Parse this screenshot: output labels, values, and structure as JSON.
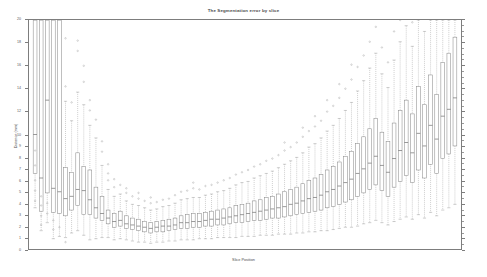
{
  "chart_data": {
    "type": "boxplot",
    "title": "The Segmentation error by slice",
    "xlabel": "Slice Position",
    "ylabel": "Distance (mm)",
    "ylim": [
      0,
      20
    ],
    "xlim": [
      0,
      71
    ],
    "grid": false,
    "legend": null,
    "y_major_ticks": [
      0,
      1,
      2,
      3,
      4,
      5,
      6,
      7,
      8,
      9,
      10,
      12,
      14,
      16,
      18,
      20
    ],
    "y_tick_labels": [
      "0",
      "1",
      "2",
      "3",
      "4",
      "5",
      "6",
      "7",
      "8",
      "9",
      "10",
      "12",
      "14",
      "16",
      "18",
      "20"
    ],
    "x_tick_labels": [],
    "box_color": "#8c8c8c",
    "whisker_color": "#9e9e9e",
    "median_color": "#6e6e6e",
    "outlier_color": "#a8a8a8",
    "n_boxes": 70,
    "boxes": [
      {
        "x": 1,
        "q1": 6.6,
        "median": 10.0,
        "q3": 20.0,
        "whisker_low": 3.6,
        "whisker_high": 20.0,
        "outliers": [
          4.2,
          5.1,
          6.0,
          7.3,
          8.6
        ]
      },
      {
        "x": 2,
        "q1": 3.3,
        "median": 6.2,
        "q3": 20.0,
        "whisker_low": 1.6,
        "whisker_high": 20.0,
        "outliers": [
          2.1,
          2.9,
          3.8,
          4.6
        ]
      },
      {
        "x": 3,
        "q1": 4.9,
        "median": 13.0,
        "q3": 20.0,
        "whisker_low": 2.3,
        "whisker_high": 20.0,
        "outliers": [
          3.1,
          4.0
        ]
      },
      {
        "x": 4,
        "q1": 3.2,
        "median": 5.3,
        "q3": 20.0,
        "whisker_low": 0.9,
        "whisker_high": 20.0,
        "outliers": [
          1.7,
          2.5
        ]
      },
      {
        "x": 5,
        "q1": 3.1,
        "median": 5.0,
        "q3": 20.0,
        "whisker_low": 1.1,
        "whisker_high": 20.0,
        "outliers": [
          1.9
        ]
      },
      {
        "x": 6,
        "q1": 2.9,
        "median": 4.4,
        "q3": 7.1,
        "whisker_low": 1.0,
        "whisker_high": 12.9,
        "outliers": [
          0.6,
          14.2,
          18.4
        ]
      },
      {
        "x": 7,
        "q1": 3.4,
        "median": 4.6,
        "q3": 6.7,
        "whisker_low": 1.4,
        "whisker_high": 11.2,
        "outliers": [
          12.8
        ]
      },
      {
        "x": 8,
        "q1": 3.8,
        "median": 5.2,
        "q3": 8.4,
        "whisker_low": 1.6,
        "whisker_high": 13.7,
        "outliers": [
          17.3,
          18.2
        ]
      },
      {
        "x": 9,
        "q1": 3.0,
        "median": 5.1,
        "q3": 7.2,
        "whisker_low": 1.2,
        "whisker_high": 12.6,
        "outliers": [
          14.6,
          16.0
        ]
      },
      {
        "x": 10,
        "q1": 3.0,
        "median": 4.3,
        "q3": 6.9,
        "whisker_low": 0.8,
        "whisker_high": 10.8,
        "outliers": [
          12.1,
          13.0
        ]
      },
      {
        "x": 11,
        "q1": 2.7,
        "median": 3.6,
        "q3": 5.4,
        "whisker_low": 0.9,
        "whisker_high": 9.7,
        "outliers": [
          11.3
        ]
      },
      {
        "x": 12,
        "q1": 2.5,
        "median": 3.1,
        "q3": 4.6,
        "whisker_low": 1.0,
        "whisker_high": 7.3,
        "outliers": [
          8.5,
          9.4
        ]
      },
      {
        "x": 13,
        "q1": 2.2,
        "median": 2.7,
        "q3": 3.4,
        "whisker_low": 1.0,
        "whisker_high": 5.2,
        "outliers": [
          6.0,
          6.6,
          7.4
        ]
      },
      {
        "x": 14,
        "q1": 1.9,
        "median": 2.4,
        "q3": 3.1,
        "whisker_low": 0.8,
        "whisker_high": 4.6,
        "outliers": [
          5.4,
          6.1
        ]
      },
      {
        "x": 15,
        "q1": 2.0,
        "median": 2.5,
        "q3": 3.3,
        "whisker_low": 0.9,
        "whisker_high": 4.8,
        "outliers": [
          5.6
        ]
      },
      {
        "x": 16,
        "q1": 1.8,
        "median": 2.2,
        "q3": 2.9,
        "whisker_low": 0.8,
        "whisker_high": 4.2,
        "outliers": [
          4.9,
          5.3
        ]
      },
      {
        "x": 17,
        "q1": 1.7,
        "median": 2.1,
        "q3": 2.7,
        "whisker_low": 0.7,
        "whisker_high": 3.9,
        "outliers": [
          4.6
        ]
      },
      {
        "x": 18,
        "q1": 1.6,
        "median": 2.0,
        "q3": 2.6,
        "whisker_low": 0.6,
        "whisker_high": 3.8,
        "outliers": [
          4.4,
          4.9
        ]
      },
      {
        "x": 19,
        "q1": 1.5,
        "median": 1.9,
        "q3": 2.4,
        "whisker_low": 0.6,
        "whisker_high": 3.6,
        "outliers": [
          4.2
        ]
      },
      {
        "x": 20,
        "q1": 1.4,
        "median": 1.8,
        "q3": 2.3,
        "whisker_low": 0.5,
        "whisker_high": 3.4,
        "outliers": [
          4.0,
          4.5
        ]
      },
      {
        "x": 21,
        "q1": 1.5,
        "median": 1.9,
        "q3": 2.4,
        "whisker_low": 0.6,
        "whisker_high": 3.5,
        "outliers": [
          4.1
        ]
      },
      {
        "x": 22,
        "q1": 1.5,
        "median": 2.0,
        "q3": 2.5,
        "whisker_low": 0.6,
        "whisker_high": 3.7,
        "outliers": [
          4.3
        ]
      },
      {
        "x": 23,
        "q1": 1.6,
        "median": 2.0,
        "q3": 2.6,
        "whisker_low": 0.7,
        "whisker_high": 3.8,
        "outliers": [
          4.4
        ]
      },
      {
        "x": 24,
        "q1": 1.7,
        "median": 2.1,
        "q3": 2.7,
        "whisker_low": 0.7,
        "whisker_high": 4.0,
        "outliers": [
          4.7
        ]
      },
      {
        "x": 25,
        "q1": 1.8,
        "median": 2.3,
        "q3": 2.9,
        "whisker_low": 0.8,
        "whisker_high": 4.3,
        "outliers": [
          5.0
        ]
      },
      {
        "x": 26,
        "q1": 1.8,
        "median": 2.3,
        "q3": 3.0,
        "whisker_low": 0.8,
        "whisker_high": 4.4,
        "outliers": [
          5.1
        ]
      },
      {
        "x": 27,
        "q1": 1.9,
        "median": 2.4,
        "q3": 3.1,
        "whisker_low": 0.8,
        "whisker_high": 4.5,
        "outliers": [
          5.3,
          5.8
        ]
      },
      {
        "x": 28,
        "q1": 1.9,
        "median": 2.4,
        "q3": 3.1,
        "whisker_low": 0.9,
        "whisker_high": 4.5,
        "outliers": [
          5.2
        ]
      },
      {
        "x": 29,
        "q1": 2.0,
        "median": 2.5,
        "q3": 3.2,
        "whisker_low": 0.9,
        "whisker_high": 4.7,
        "outliers": [
          5.5
        ]
      },
      {
        "x": 30,
        "q1": 2.0,
        "median": 2.6,
        "q3": 3.3,
        "whisker_low": 0.9,
        "whisker_high": 4.8,
        "outliers": [
          5.6
        ]
      },
      {
        "x": 31,
        "q1": 2.1,
        "median": 2.6,
        "q3": 3.4,
        "whisker_low": 1.0,
        "whisker_high": 5.0,
        "outliers": [
          5.8
        ]
      },
      {
        "x": 32,
        "q1": 2.1,
        "median": 2.7,
        "q3": 3.5,
        "whisker_low": 1.0,
        "whisker_high": 5.1,
        "outliers": [
          6.0
        ]
      },
      {
        "x": 33,
        "q1": 2.2,
        "median": 2.8,
        "q3": 3.6,
        "whisker_low": 1.0,
        "whisker_high": 5.3,
        "outliers": [
          6.2
        ]
      },
      {
        "x": 34,
        "q1": 2.3,
        "median": 2.9,
        "q3": 3.8,
        "whisker_low": 1.0,
        "whisker_high": 5.6,
        "outliers": [
          6.5
        ]
      },
      {
        "x": 35,
        "q1": 2.3,
        "median": 3.0,
        "q3": 3.9,
        "whisker_low": 1.1,
        "whisker_high": 5.8,
        "outliers": [
          6.7
        ]
      },
      {
        "x": 36,
        "q1": 2.4,
        "median": 3.1,
        "q3": 4.0,
        "whisker_low": 1.1,
        "whisker_high": 5.9,
        "outliers": [
          6.9
        ]
      },
      {
        "x": 37,
        "q1": 2.5,
        "median": 3.2,
        "q3": 4.2,
        "whisker_low": 1.1,
        "whisker_high": 6.2,
        "outliers": [
          7.2
        ]
      },
      {
        "x": 38,
        "q1": 2.5,
        "median": 3.3,
        "q3": 4.3,
        "whisker_low": 1.2,
        "whisker_high": 6.4,
        "outliers": [
          7.4
        ]
      },
      {
        "x": 39,
        "q1": 2.6,
        "median": 3.4,
        "q3": 4.5,
        "whisker_low": 1.2,
        "whisker_high": 6.6,
        "outliers": [
          7.7
        ]
      },
      {
        "x": 40,
        "q1": 2.7,
        "median": 3.5,
        "q3": 4.6,
        "whisker_low": 1.2,
        "whisker_high": 6.8,
        "outliers": [
          7.9
        ]
      },
      {
        "x": 41,
        "q1": 2.7,
        "median": 3.6,
        "q3": 4.8,
        "whisker_low": 1.3,
        "whisker_high": 7.1,
        "outliers": [
          8.2
        ]
      },
      {
        "x": 42,
        "q1": 2.8,
        "median": 3.7,
        "q3": 5.0,
        "whisker_low": 1.3,
        "whisker_high": 7.4,
        "outliers": [
          8.6,
          9.3
        ]
      },
      {
        "x": 43,
        "q1": 2.9,
        "median": 3.9,
        "q3": 5.2,
        "whisker_low": 1.3,
        "whisker_high": 7.7,
        "outliers": [
          8.9
        ]
      },
      {
        "x": 44,
        "q1": 3.0,
        "median": 4.0,
        "q3": 5.4,
        "whisker_low": 1.4,
        "whisker_high": 8.0,
        "outliers": [
          9.3
        ]
      },
      {
        "x": 45,
        "q1": 3.1,
        "median": 4.2,
        "q3": 5.7,
        "whisker_low": 1.4,
        "whisker_high": 8.4,
        "outliers": [
          9.8,
          10.6
        ]
      },
      {
        "x": 46,
        "q1": 3.2,
        "median": 4.4,
        "q3": 6.0,
        "whisker_low": 1.5,
        "whisker_high": 8.9,
        "outliers": [
          10.3
        ]
      },
      {
        "x": 47,
        "q1": 3.3,
        "median": 4.5,
        "q3": 6.2,
        "whisker_low": 1.5,
        "whisker_high": 9.2,
        "outliers": [
          10.7,
          11.6
        ]
      },
      {
        "x": 48,
        "q1": 3.4,
        "median": 4.7,
        "q3": 6.5,
        "whisker_low": 1.6,
        "whisker_high": 9.7,
        "outliers": [
          11.2
        ]
      },
      {
        "x": 49,
        "q1": 3.6,
        "median": 5.0,
        "q3": 6.9,
        "whisker_low": 1.6,
        "whisker_high": 10.3,
        "outliers": [
          12.0,
          13.0
        ]
      },
      {
        "x": 50,
        "q1": 3.7,
        "median": 5.2,
        "q3": 7.2,
        "whisker_low": 1.7,
        "whisker_high": 10.8,
        "outliers": [
          12.5
        ]
      },
      {
        "x": 51,
        "q1": 3.9,
        "median": 5.5,
        "q3": 7.6,
        "whisker_low": 1.8,
        "whisker_high": 11.4,
        "outliers": [
          13.2,
          14.4
        ]
      },
      {
        "x": 52,
        "q1": 4.1,
        "median": 5.8,
        "q3": 8.1,
        "whisker_low": 1.9,
        "whisker_high": 12.1,
        "outliers": [
          14.0
        ]
      },
      {
        "x": 53,
        "q1": 4.3,
        "median": 6.1,
        "q3": 8.5,
        "whisker_low": 1.9,
        "whisker_high": 12.8,
        "outliers": [
          14.8,
          16.1
        ]
      },
      {
        "x": 54,
        "q1": 4.6,
        "median": 6.6,
        "q3": 9.2,
        "whisker_low": 2.0,
        "whisker_high": 13.8,
        "outliers": [
          15.9
        ]
      },
      {
        "x": 55,
        "q1": 4.9,
        "median": 7.0,
        "q3": 9.8,
        "whisker_low": 2.2,
        "whisker_high": 14.7,
        "outliers": [
          16.9
        ]
      },
      {
        "x": 56,
        "q1": 5.2,
        "median": 7.5,
        "q3": 10.5,
        "whisker_low": 2.3,
        "whisker_high": 15.8,
        "outliers": [
          18.1
        ]
      },
      {
        "x": 57,
        "q1": 5.6,
        "median": 8.1,
        "q3": 11.4,
        "whisker_low": 2.5,
        "whisker_high": 17.1,
        "outliers": [
          19.4
        ]
      },
      {
        "x": 58,
        "q1": 5.1,
        "median": 7.3,
        "q3": 10.2,
        "whisker_low": 2.3,
        "whisker_high": 15.3,
        "outliers": [
          17.6
        ]
      },
      {
        "x": 59,
        "q1": 4.6,
        "median": 6.7,
        "q3": 9.4,
        "whisker_low": 2.1,
        "whisker_high": 14.1,
        "outliers": [
          16.3
        ]
      },
      {
        "x": 60,
        "q1": 5.4,
        "median": 7.9,
        "q3": 11.0,
        "whisker_low": 2.4,
        "whisker_high": 16.5,
        "outliers": [
          19.0
        ]
      },
      {
        "x": 61,
        "q1": 5.9,
        "median": 8.6,
        "q3": 12.1,
        "whisker_low": 2.6,
        "whisker_high": 18.1,
        "outliers": [
          20.0
        ]
      },
      {
        "x": 62,
        "q1": 6.4,
        "median": 9.3,
        "q3": 13.0,
        "whisker_low": 2.8,
        "whisker_high": 19.5,
        "outliers": []
      },
      {
        "x": 63,
        "q1": 5.8,
        "median": 8.4,
        "q3": 11.8,
        "whisker_low": 2.6,
        "whisker_high": 17.7,
        "outliers": [
          19.8
        ]
      },
      {
        "x": 64,
        "q1": 6.9,
        "median": 10.1,
        "q3": 14.2,
        "whisker_low": 3.0,
        "whisker_high": 20.0,
        "outliers": []
      },
      {
        "x": 65,
        "q1": 6.2,
        "median": 9.0,
        "q3": 12.6,
        "whisker_low": 2.7,
        "whisker_high": 19.0,
        "outliers": []
      },
      {
        "x": 66,
        "q1": 7.4,
        "median": 10.8,
        "q3": 15.2,
        "whisker_low": 3.2,
        "whisker_high": 20.0,
        "outliers": []
      },
      {
        "x": 67,
        "q1": 6.6,
        "median": 9.6,
        "q3": 13.5,
        "whisker_low": 2.9,
        "whisker_high": 20.0,
        "outliers": []
      },
      {
        "x": 68,
        "q1": 7.9,
        "median": 11.6,
        "q3": 16.3,
        "whisker_low": 3.4,
        "whisker_high": 20.0,
        "outliers": []
      },
      {
        "x": 69,
        "q1": 8.3,
        "median": 12.2,
        "q3": 17.1,
        "whisker_low": 3.6,
        "whisker_high": 20.0,
        "outliers": []
      },
      {
        "x": 70,
        "q1": 9.0,
        "median": 13.2,
        "q3": 18.5,
        "whisker_low": 3.9,
        "whisker_high": 20.0,
        "outliers": []
      }
    ]
  }
}
